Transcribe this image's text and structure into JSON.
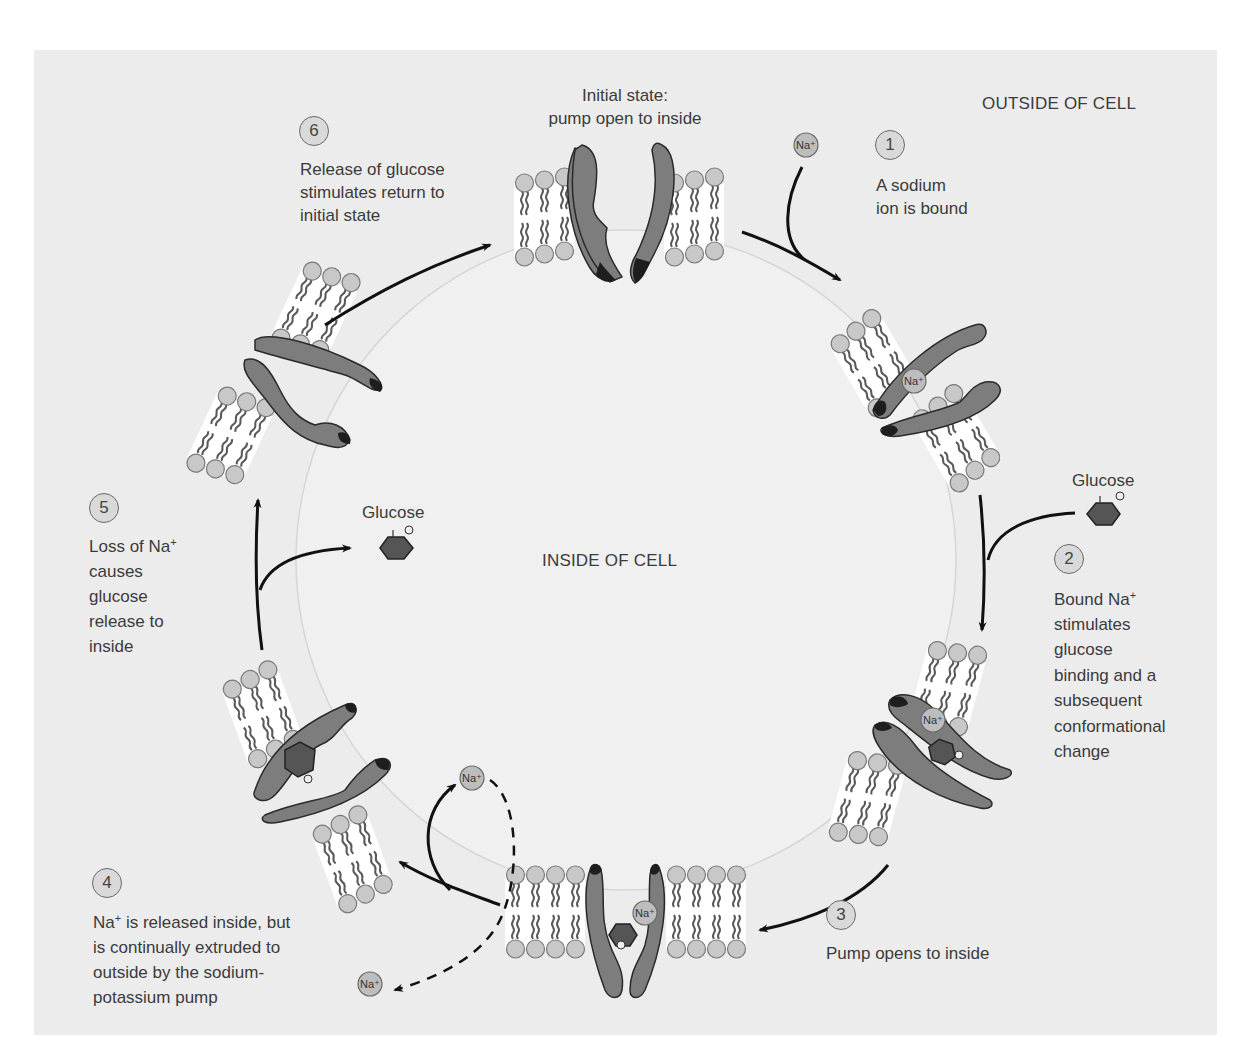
{
  "regions": {
    "outside": "OUTSIDE OF CELL",
    "inside": "INSIDE OF CELL"
  },
  "initial_state": {
    "line1": "Initial state:",
    "line2": "pump open to inside"
  },
  "steps": [
    {
      "number": "1",
      "lines": [
        "A sodium",
        "ion is bound"
      ]
    },
    {
      "number": "2",
      "lines": [
        "Bound Na",
        "stimulates",
        "glucose",
        "binding and a",
        "subsequent",
        "conformational",
        "change"
      ],
      "sup_line0": "+"
    },
    {
      "number": "3",
      "lines": [
        "Pump opens to inside"
      ]
    },
    {
      "number": "4",
      "lines": [
        "Na",
        " is released inside, but",
        "is continually extruded to",
        "outside by the sodium-",
        "potassium pump"
      ],
      "sup": "+"
    },
    {
      "number": "5",
      "lines": [
        "Loss of Na",
        "causes",
        "glucose",
        "release to",
        "inside"
      ],
      "sup_line0": "+"
    },
    {
      "number": "6",
      "lines": [
        "Release of glucose",
        "stimulates return to",
        "initial state"
      ]
    }
  ],
  "molecules": {
    "glucose_label": "Glucose",
    "glucose_oxygen": "O",
    "sodium_label": "Na",
    "sodium_charge": "+"
  },
  "colors": {
    "background_panel": "#ececec",
    "inside_cell": "#f0f0f0",
    "protein": "#7d7d7d",
    "protein_tip": "#1e1e1e",
    "glucose": "#555555",
    "lipid_head": "#c8c8c8",
    "lipid_tail": "#5a5a5a",
    "ion": "#bdbdbd",
    "arrow": "#111111"
  }
}
